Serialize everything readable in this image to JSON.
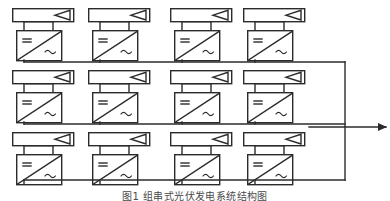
{
  "figure": {
    "caption": "图1  组串式光伏发电系统结构图",
    "alt_title": "Photovoltaic string inverter system block diagram",
    "background_color": "#ffffff",
    "line_color": "#2b2b2b",
    "fill_color": "#ffffff"
  },
  "legend": {
    "pv_panel_name": "pv-panel-symbol",
    "inverter_name": "dc-ac-inverter-symbol",
    "dc_label": "=",
    "ac_label": "~",
    "bus_name": "collector-bus",
    "output_arrow_name": "grid-output-arrow"
  },
  "layout": {
    "columns": 4,
    "rows": 3,
    "column_x": [
      12,
      88,
      170,
      243
    ],
    "row_y": [
      8,
      70,
      132
    ],
    "panel_width": 61,
    "panel_height": 13,
    "inverter_width": 45,
    "inverter_height": 30,
    "bus_x_right": 345,
    "bus_y": [
      62,
      124,
      180
    ],
    "output_arrow_y": 127,
    "output_arrow_x_end": 386
  },
  "units": [
    {
      "id": "unit-r1c1",
      "row": 1,
      "col": 1,
      "panel": "pv-panel-r1c1",
      "inverter": "inverter-r1c1"
    },
    {
      "id": "unit-r1c2",
      "row": 1,
      "col": 2,
      "panel": "pv-panel-r1c2",
      "inverter": "inverter-r1c2"
    },
    {
      "id": "unit-r1c3",
      "row": 1,
      "col": 3,
      "panel": "pv-panel-r1c3",
      "inverter": "inverter-r1c3"
    },
    {
      "id": "unit-r1c4",
      "row": 1,
      "col": 4,
      "panel": "pv-panel-r1c4",
      "inverter": "inverter-r1c4"
    },
    {
      "id": "unit-r2c1",
      "row": 2,
      "col": 1,
      "panel": "pv-panel-r2c1",
      "inverter": "inverter-r2c1"
    },
    {
      "id": "unit-r2c2",
      "row": 2,
      "col": 2,
      "panel": "pv-panel-r2c2",
      "inverter": "inverter-r2c2"
    },
    {
      "id": "unit-r2c3",
      "row": 2,
      "col": 3,
      "panel": "pv-panel-r2c3",
      "inverter": "inverter-r2c3"
    },
    {
      "id": "unit-r2c4",
      "row": 2,
      "col": 4,
      "panel": "pv-panel-r2c4",
      "inverter": "inverter-r2c4"
    },
    {
      "id": "unit-r3c1",
      "row": 3,
      "col": 1,
      "panel": "pv-panel-r3c1",
      "inverter": "inverter-r3c1"
    },
    {
      "id": "unit-r3c2",
      "row": 3,
      "col": 2,
      "panel": "pv-panel-r3c2",
      "inverter": "inverter-r3c2"
    },
    {
      "id": "unit-r3c3",
      "row": 3,
      "col": 3,
      "panel": "pv-panel-r3c3",
      "inverter": "inverter-r3c3"
    },
    {
      "id": "unit-r3c4",
      "row": 3,
      "col": 4,
      "panel": "pv-panel-r3c4",
      "inverter": "inverter-r3c4"
    }
  ],
  "symbols": {
    "dc": "=",
    "ac": "~"
  }
}
